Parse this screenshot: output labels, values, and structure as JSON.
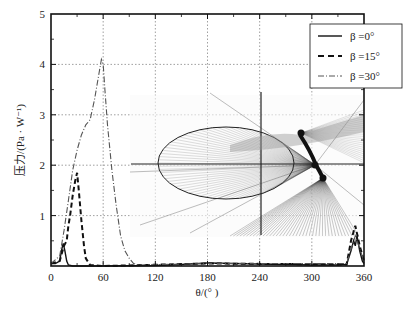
{
  "chart_data": {
    "type": "line",
    "title": "",
    "xlabel": "θ/(°)",
    "ylabel": "压力/(Pa · W⁻¹)",
    "xlim": [
      0,
      360
    ],
    "ylim": [
      0,
      5
    ],
    "xticks": [
      0,
      60,
      120,
      180,
      240,
      300,
      360
    ],
    "yticks": [
      1,
      2,
      3,
      4,
      5
    ],
    "grid": true,
    "legend_position": "upper right",
    "series": [
      {
        "name": "β=0°",
        "style": "solid",
        "x": [
          0,
          5,
          10,
          12,
          14,
          16,
          18,
          20,
          25,
          30,
          60,
          120,
          150,
          180,
          210,
          240,
          270,
          300,
          330,
          340,
          345,
          348,
          350,
          352,
          355,
          358,
          360
        ],
        "values": [
          0.05,
          0.05,
          0.1,
          0.3,
          0.45,
          0.3,
          0.1,
          0.02,
          0.0,
          0.0,
          0.0,
          0.01,
          0.03,
          0.06,
          0.05,
          0.04,
          0.03,
          0.02,
          0.02,
          0.03,
          0.3,
          0.5,
          0.4,
          0.6,
          0.3,
          0.1,
          0.05
        ]
      },
      {
        "name": "β=15°",
        "style": "dashed",
        "x": [
          0,
          10,
          15,
          18,
          20,
          22,
          25,
          28,
          30,
          32,
          35,
          38,
          40,
          45,
          60,
          180,
          340,
          345,
          350,
          355,
          360
        ],
        "values": [
          0.05,
          0.1,
          0.4,
          0.5,
          0.8,
          1.0,
          1.4,
          1.7,
          1.85,
          1.5,
          0.9,
          0.4,
          0.15,
          0.02,
          0.0,
          0.05,
          0.03,
          0.5,
          0.8,
          0.4,
          0.1
        ]
      },
      {
        "name": "β=30°",
        "style": "dash-dot",
        "x": [
          0,
          10,
          15,
          20,
          25,
          30,
          35,
          40,
          45,
          50,
          55,
          58,
          60,
          62,
          65,
          70,
          75,
          80,
          85,
          90,
          95,
          100,
          180,
          340,
          350,
          360
        ],
        "values": [
          0.05,
          0.2,
          0.7,
          1.3,
          1.9,
          2.3,
          2.6,
          2.8,
          2.9,
          3.3,
          3.8,
          4.1,
          4.0,
          3.5,
          2.8,
          1.9,
          1.2,
          0.6,
          0.3,
          0.15,
          0.05,
          0.02,
          0.05,
          0.05,
          0.6,
          0.1
        ]
      }
    ],
    "inset": "3D acoustic ray geometry diagram (ellipse with radiating lines) overlaid in plot area"
  },
  "legend": {
    "items": [
      {
        "label": "β =0°"
      },
      {
        "label": "β =15°"
      },
      {
        "label": "β =30°"
      }
    ]
  },
  "axes": {
    "x_title": "θ/(° )",
    "y_title": "压力/(Pa · W⁻¹)",
    "x_tick_labels": [
      "0",
      "60",
      "120",
      "180",
      "240",
      "300",
      "360"
    ],
    "y_tick_labels": [
      "1",
      "2",
      "3",
      "4",
      "5"
    ]
  }
}
